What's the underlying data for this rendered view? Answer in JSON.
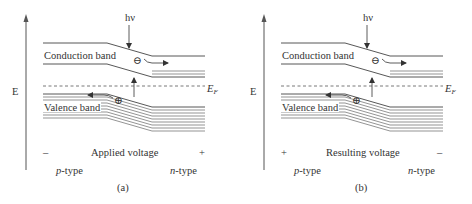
{
  "figure": {
    "panels": [
      {
        "id": "a",
        "caption": "(a)",
        "axis_label": "E",
        "photon_label": "hν",
        "conduction_label": "Conduction band",
        "valence_label": "Valence band",
        "fermi_label": "E",
        "fermi_sub": "F",
        "electron_symbol": "⊖",
        "hole_symbol": "⊕",
        "left_sign": "–",
        "right_sign": "+",
        "voltage_label": "Applied voltage",
        "left_type_prefix": "p",
        "right_type_prefix": "n",
        "type_suffix": "-type"
      },
      {
        "id": "b",
        "caption": "(b)",
        "axis_label": "E",
        "photon_label": "hν",
        "conduction_label": "Conduction band",
        "valence_label": "Valence band",
        "fermi_label": "E",
        "fermi_sub": "F",
        "electron_symbol": "⊖",
        "hole_symbol": "⊕",
        "left_sign": "+",
        "right_sign": "–",
        "voltage_label": "Resulting voltage",
        "left_type_prefix": "p",
        "right_type_prefix": "n",
        "type_suffix": "-type"
      }
    ],
    "colors": {
      "line": "#444444",
      "text": "#333333",
      "background": "#ffffff"
    }
  }
}
